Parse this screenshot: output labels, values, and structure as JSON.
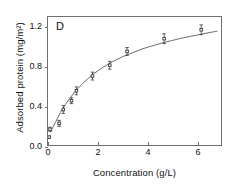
{
  "chart_data": {
    "type": "scatter",
    "title": "",
    "panel_label": "D",
    "xlabel": "Concentration (g/L)",
    "ylabel": "Adsorbed protein (mg/m²)",
    "xlim": [
      0,
      7
    ],
    "ylim": [
      0,
      1.3
    ],
    "xticks": [
      0,
      2,
      4,
      6
    ],
    "xtick_labels": [
      "0",
      "2",
      "4",
      "6"
    ],
    "yticks": [
      0.0,
      0.4,
      0.8,
      1.2
    ],
    "ytick_labels": [
      "0.0",
      "0.4",
      "0.8",
      "1.2"
    ],
    "grid": false,
    "legend": "none",
    "marker": "open-square",
    "marker_color": "#3a3a3a",
    "line_color": "#6a6a6a",
    "axis_color": "#6f6f6f",
    "error_bars": "vertical",
    "points": [
      {
        "x": 0.05,
        "y": 0.08,
        "yerr": 0.01
      },
      {
        "x": 0.08,
        "y": 0.16,
        "yerr": 0.02
      },
      {
        "x": 0.45,
        "y": 0.22,
        "yerr": 0.03
      },
      {
        "x": 0.62,
        "y": 0.36,
        "yerr": 0.04
      },
      {
        "x": 0.95,
        "y": 0.45,
        "yerr": 0.03
      },
      {
        "x": 1.15,
        "y": 0.55,
        "yerr": 0.04
      },
      {
        "x": 1.8,
        "y": 0.7,
        "yerr": 0.04
      },
      {
        "x": 2.5,
        "y": 0.81,
        "yerr": 0.04
      },
      {
        "x": 3.2,
        "y": 0.95,
        "yerr": 0.04
      },
      {
        "x": 4.7,
        "y": 1.08,
        "yerr": 0.05
      },
      {
        "x": 6.2,
        "y": 1.17,
        "yerr": 0.05
      }
    ],
    "fit_curve": {
      "model": "langmuir-type saturation",
      "description": "smooth rising saturating curve through data",
      "x": [
        0.1,
        0.3,
        0.5,
        0.7,
        0.9,
        1.1,
        1.4,
        1.8,
        2.2,
        2.6,
        3.0,
        3.4,
        3.8,
        4.2,
        4.6,
        5.0,
        5.4,
        5.8,
        6.2,
        6.6,
        6.85
      ],
      "y": [
        0.13,
        0.23,
        0.33,
        0.41,
        0.48,
        0.545,
        0.625,
        0.715,
        0.785,
        0.845,
        0.895,
        0.935,
        0.975,
        1.005,
        1.035,
        1.06,
        1.085,
        1.105,
        1.125,
        1.145,
        1.155
      ]
    }
  }
}
